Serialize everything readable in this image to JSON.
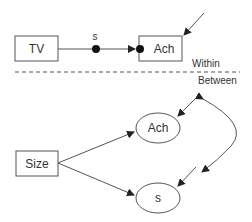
{
  "diagram": {
    "colors": {
      "stroke": "#444444",
      "text": "#333333",
      "background": "#ffffff"
    },
    "within_level": {
      "nodes": [
        {
          "id": "tv",
          "shape": "rect",
          "label": "TV"
        },
        {
          "id": "ach",
          "shape": "rect",
          "label": "Ach"
        }
      ],
      "random_slope": {
        "label": "s"
      },
      "section_label": "Within"
    },
    "divider": {
      "style": "dashed"
    },
    "between_level": {
      "section_label": "Between",
      "nodes": [
        {
          "id": "size",
          "shape": "rect",
          "label": "Size"
        },
        {
          "id": "ach_between",
          "shape": "ellipse",
          "label": "Ach"
        },
        {
          "id": "s_between",
          "shape": "ellipse",
          "label": "s"
        }
      ]
    },
    "edges": [
      {
        "from": "tv",
        "to": "ach",
        "via": "s",
        "type": "directed"
      },
      {
        "from": "residual",
        "to": "ach",
        "type": "directed"
      },
      {
        "from": "size",
        "to": "ach_between",
        "type": "directed"
      },
      {
        "from": "size",
        "to": "s_between",
        "type": "directed"
      },
      {
        "from": "residual",
        "to": "ach_between",
        "type": "directed"
      },
      {
        "from": "residual",
        "to": "s_between",
        "type": "directed"
      },
      {
        "from": "ach_between",
        "to": "s_between",
        "type": "covariance"
      }
    ]
  }
}
